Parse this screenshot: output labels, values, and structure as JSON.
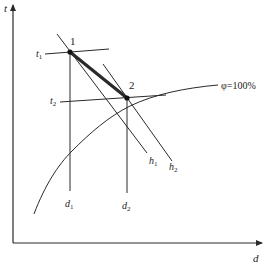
{
  "diagram": {
    "type": "psychrometric-process",
    "axes": {
      "y_label": "t",
      "x_label": "d"
    },
    "points": [
      {
        "id": "1",
        "label": "1"
      },
      {
        "id": "2",
        "label": "2"
      }
    ],
    "isotherms": [
      {
        "label_main": "t",
        "label_sub": "1"
      },
      {
        "label_main": "t",
        "label_sub": "2"
      }
    ],
    "moisture_lines": [
      {
        "label_main": "d",
        "label_sub": "1"
      },
      {
        "label_main": "d",
        "label_sub": "2"
      }
    ],
    "enthalpy_lines": [
      {
        "label_main": "h",
        "label_sub": "1"
      },
      {
        "label_main": "h",
        "label_sub": "2"
      }
    ],
    "saturation_curve": {
      "label": "φ=100%"
    },
    "colors": {
      "line": "#2a2a2a",
      "background": "#ffffff"
    }
  }
}
